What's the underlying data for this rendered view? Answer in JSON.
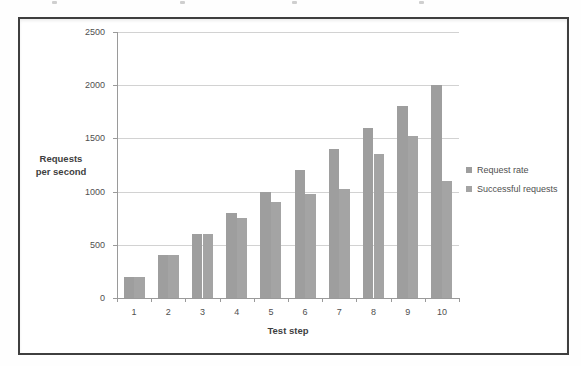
{
  "chart_data": {
    "type": "bar",
    "title": "",
    "xlabel": "Test step",
    "ylabel": "Requests per second",
    "ylabel_lines": [
      "Requests",
      "per second"
    ],
    "categories": [
      "1",
      "2",
      "3",
      "4",
      "5",
      "6",
      "7",
      "8",
      "9",
      "10"
    ],
    "series": [
      {
        "name": "Request rate",
        "color": "#9e9e9e",
        "values": [
          200,
          400,
          600,
          800,
          1000,
          1200,
          1400,
          1600,
          1800,
          2000
        ]
      },
      {
        "name": "Successful requests",
        "color": "#a4a4a4",
        "values": [
          200,
          400,
          600,
          750,
          900,
          975,
          1025,
          1350,
          1520,
          1100
        ]
      }
    ],
    "ylim": [
      0,
      2500
    ],
    "ytick_interval": 500,
    "ytick_labels": [
      "0",
      "500",
      "1000",
      "1500",
      "2000",
      "2500"
    ],
    "grid": true,
    "legend_position": "right",
    "colors": {
      "gridline": "#d2d2d2",
      "axis": "#9a9a9a",
      "border": "#3f3f3f",
      "text": "#4f4f4f"
    }
  }
}
